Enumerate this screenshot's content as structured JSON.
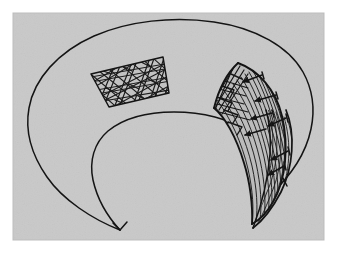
{
  "figure": {
    "title": "Annular surface with two textured patches",
    "caption": "",
    "domain_kind": "line-drawing",
    "canvas": {
      "width": 337,
      "height": 253,
      "outer_background": "#ffffff",
      "panel_background": "#c9c9c9",
      "panel_noise": "#c0c0c0",
      "ink_color": "#1a1a1a",
      "panel": {
        "x": 13,
        "y": 13,
        "width": 311,
        "height": 227
      }
    },
    "elements": [
      {
        "id": "outer-contour",
        "name": "outer-annulus-contour",
        "label": "Outer boundary curve of the annular form",
        "stroke": "#141414",
        "stroke_width": 1.5,
        "fill": "none",
        "path": "M 120 230 C 78 212 33 176 29 130 C 24 78 86 27 164 22 C 244 18 309 62 312 112 C 314 150 292 186 265 205"
      },
      {
        "id": "inner-contour",
        "name": "inner-annulus-contour",
        "label": "Inner boundary curve of the annular form",
        "stroke": "#141414",
        "stroke_width": 1.5,
        "fill": "none",
        "path": "M 120 230 C 102 208 90 180 93 159 C 97 127 140 113 174 113 C 212 113 242 124 253 140"
      },
      {
        "id": "left-patch",
        "name": "crosshatched-quad-patch",
        "label": "Upper-left quadrilateral patch with dense crosshatch texture",
        "stroke": "#141414",
        "stroke_width": 1.4,
        "fill": "#bdbdbd",
        "corners": [
          [
            91,
            74
          ],
          [
            163,
            57
          ],
          [
            169,
            93
          ],
          [
            109,
            107
          ]
        ],
        "texture": "crosshatch",
        "texture_line_count": 34
      },
      {
        "id": "right-patch",
        "name": "hatched-crescent-patch",
        "label": "Right crescent patch with directional hatching and arrow ticks",
        "stroke": "#141414",
        "stroke_width": 1.6,
        "fill": "#b8b8b8",
        "texture": "flow-lines-with-arrows",
        "texture_line_count": 26,
        "arrow_count": 7
      },
      {
        "id": "right-sliver",
        "name": "edge-sliver-patch",
        "label": "Narrow hatched sliver along the right outer edge",
        "stroke": "#141414",
        "stroke_width": 1.2,
        "fill": "none",
        "texture": "fine-hatch"
      }
    ],
    "geometry": {
      "outer_ellipse": {
        "cx": 171,
        "cy": 116,
        "rx": 142,
        "ry": 96
      },
      "inner_ellipse": {
        "cx": 178,
        "cy": 168,
        "rx": 86,
        "ry": 56
      },
      "cusp_point": {
        "x": 120,
        "y": 230
      },
      "outer_top_y": 20,
      "outer_left_x": 29,
      "outer_right_x": 312,
      "inner_top_y": 113
    }
  }
}
